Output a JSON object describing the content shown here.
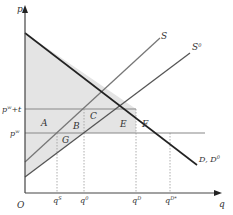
{
  "diagram": {
    "type": "supply-demand-tariff",
    "axes": {
      "y_label": "p",
      "x_label": "q",
      "origin_label": "O"
    },
    "price_levels": [
      {
        "id": "pw_t",
        "label_base": "p",
        "label_sup": "w",
        "label_suffix": "+t"
      },
      {
        "id": "pw",
        "label_base": "p",
        "label_sup": "w"
      }
    ],
    "quantity_ticks": [
      {
        "id": "qS",
        "label_base": "q",
        "label_sup": "S"
      },
      {
        "id": "q0",
        "label_base": "q",
        "label_sup": "0"
      },
      {
        "id": "qD",
        "label_base": "q",
        "label_sup": "D"
      },
      {
        "id": "qDstar",
        "label_base": "q",
        "label_sup": "D*"
      }
    ],
    "curves": [
      {
        "id": "S",
        "label": "S"
      },
      {
        "id": "S0",
        "label_base": "S",
        "label_sup": "0"
      },
      {
        "id": "D",
        "label_base": "D, D",
        "label_sup": "0"
      }
    ],
    "area_labels": [
      "A",
      "B",
      "C",
      "E",
      "F",
      "G"
    ],
    "colors": {
      "shade": "#e4e4e4",
      "demand": "#222222",
      "supply": "#777777",
      "price_line": "#888888",
      "axis": "#444444",
      "guide": "#999999"
    }
  }
}
